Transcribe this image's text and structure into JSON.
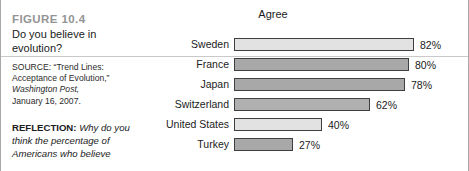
{
  "caption": {
    "figure_number": "FIGURE 10.4",
    "title": "Do you believe in evolution?",
    "source": {
      "prefix": "SOURCE: “Trend Lines:",
      "line2": "Acceptance of Evolution,”",
      "publication": "Washington Post,",
      "date": "January 16, 2007."
    },
    "reflection": {
      "label": "REFLECTION:",
      "body": "Why do you think the percentage of Americans who believe"
    }
  },
  "chart_data": {
    "type": "bar",
    "orientation": "horizontal",
    "title": "Agree",
    "xlabel": "",
    "ylabel": "",
    "xlim": [
      0,
      88
    ],
    "grid": false,
    "legend": null,
    "value_suffix": "%",
    "categories": [
      "Sweden",
      "France",
      "Japan",
      "Switzerland",
      "United States",
      "Turkey"
    ],
    "values": [
      82,
      80,
      78,
      62,
      40,
      27
    ],
    "value_labels": [
      "82%",
      "80%",
      "78%",
      "62%",
      "40%",
      "27%"
    ],
    "bar_colors": [
      "#e2e2e2",
      "#a8a8a8",
      "#a8a8a8",
      "#b0b0b0",
      "#e2e2e2",
      "#a8a8a8"
    ],
    "bar_border_color": "#3f3f3f"
  },
  "colors": {
    "frame_border": "#a8a8a8",
    "rule": "#c9c9c9",
    "figure_number": "#949494",
    "text": "#1b1b1b",
    "background": "#ffffff"
  }
}
